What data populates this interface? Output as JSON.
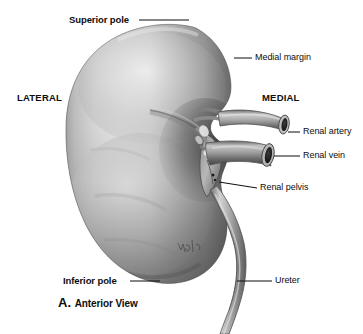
{
  "figure": {
    "caption_letter": "A.",
    "caption_text": "Anterior View",
    "background_color": "#ffffff",
    "ink_color": "#0d0d0d"
  },
  "labels": {
    "superior_pole": "Superior pole",
    "medial_margin": "Medial margin",
    "lateral": "LATERAL",
    "medial": "MEDIAL",
    "renal_artery": "Renal artery",
    "renal_vein": "Renal vein",
    "renal_pelvis": "Renal pelvis",
    "inferior_pole": "Inferior pole",
    "ureter": "Ureter"
  },
  "structures": {
    "kidney": "kidney-body",
    "renal_artery": "renal-artery-vessel",
    "renal_vein": "renal-vein-vessel",
    "renal_pelvis": "renal-pelvis-structure",
    "ureter": "ureter-tube",
    "hilum": "renal-hilum",
    "signature": "artist-signature"
  }
}
